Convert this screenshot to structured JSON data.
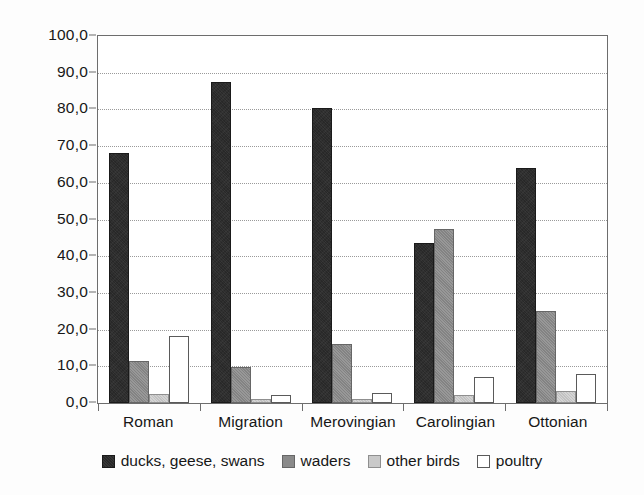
{
  "chart_data": {
    "type": "bar",
    "title": "",
    "subtitle": "",
    "xlabel": "",
    "ylabel": "",
    "ylim": [
      0,
      100
    ],
    "ytick_step": 10,
    "grid": true,
    "legend_position": "bottom",
    "decimal_separator": ",",
    "categories": [
      "Roman",
      "Migration",
      "Merovingian",
      "Carolingian",
      "Ottonian"
    ],
    "ytick_labels": [
      "0,0",
      "10,0",
      "20,0",
      "30,0",
      "40,0",
      "50,0",
      "60,0",
      "70,0",
      "80,0",
      "90,0",
      "100,0"
    ],
    "ytick_values": [
      0,
      10,
      20,
      30,
      40,
      50,
      60,
      70,
      80,
      90,
      100
    ],
    "series": [
      {
        "name": "ducks, geese, swans",
        "color": "#282828",
        "values": [
          68.0,
          87.5,
          80.5,
          43.5,
          64.0
        ]
      },
      {
        "name": "waders",
        "color": "#8a8a8a",
        "values": [
          11.5,
          9.7,
          16.0,
          47.3,
          25.0
        ]
      },
      {
        "name": "other birds",
        "color": "#c9c9c9",
        "values": [
          2.4,
          1.0,
          1.0,
          2.3,
          3.2
        ]
      },
      {
        "name": "poultry",
        "color": "#ffffff",
        "values": [
          18.2,
          2.3,
          2.6,
          7.2,
          8.0
        ]
      }
    ]
  },
  "legend": {
    "items": [
      {
        "label": "ducks, geese, swans",
        "swatch": "legend-swatch-dark"
      },
      {
        "label": "waders",
        "swatch": "legend-swatch-medium-gray"
      },
      {
        "label": "other birds",
        "swatch": "legend-swatch-light-gray"
      },
      {
        "label": "poultry",
        "swatch": "legend-swatch-white"
      }
    ]
  }
}
